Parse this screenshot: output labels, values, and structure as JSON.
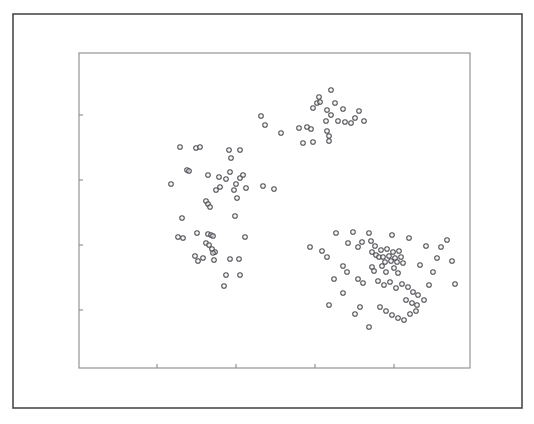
{
  "figure": {
    "title": "",
    "background_color": "#ffffff"
  },
  "outer_frame": {
    "name": "outer-border",
    "x": 13,
    "y": 14,
    "width": 509,
    "height": 394,
    "stroke_color": "#4a4a4a",
    "stroke_width": 1.6
  },
  "chart_data": {
    "type": "scatter",
    "title": "",
    "subtitle": "",
    "xlabel": "",
    "ylabel": "",
    "grid": false,
    "legend": null,
    "legend_position": "none",
    "marker": {
      "shape": "circle",
      "radius_px": 2.3,
      "stroke_color": "#4f4f55",
      "fill_color": "#f2f2f2",
      "stroke_width": 1.05
    },
    "plot_area_px": {
      "x": 79,
      "y": 53,
      "width": 391,
      "height": 315
    },
    "axes": {
      "x": {
        "range_px": [
          79,
          470
        ],
        "tick_positions_px": [
          157,
          236,
          315,
          394
        ],
        "tick_labels": [],
        "tick_length_px": 4,
        "tick_side": "inside-top"
      },
      "y": {
        "range_px": [
          53,
          368
        ],
        "tick_positions_px": [
          115,
          180,
          245,
          310
        ],
        "tick_labels": [],
        "tick_length_px": 4,
        "tick_side": "inside-right"
      }
    },
    "series": [
      {
        "name": "points",
        "n_points": 131,
        "points_px": [
          [
            319,
            97
          ],
          [
            331,
            90
          ],
          [
            317,
            103
          ],
          [
            320,
            102
          ],
          [
            335,
            103
          ],
          [
            313,
            108
          ],
          [
            327,
            110
          ],
          [
            343,
            109
          ],
          [
            359,
            111
          ],
          [
            331,
            115
          ],
          [
            355,
            118
          ],
          [
            326,
            121
          ],
          [
            338,
            121
          ],
          [
            345,
            122
          ],
          [
            351,
            123
          ],
          [
            364,
            121
          ],
          [
            265,
            125
          ],
          [
            281,
            133
          ],
          [
            299,
            128
          ],
          [
            307,
            127
          ],
          [
            311,
            129
          ],
          [
            327,
            131
          ],
          [
            329,
            136
          ],
          [
            329,
            141
          ],
          [
            303,
            143
          ],
          [
            313,
            142
          ],
          [
            261,
            116
          ],
          [
            180,
            147
          ],
          [
            196,
            148
          ],
          [
            200,
            147
          ],
          [
            229,
            150
          ],
          [
            240,
            150
          ],
          [
            231,
            158
          ],
          [
            187,
            170
          ],
          [
            189,
            171
          ],
          [
            208,
            175
          ],
          [
            230,
            172
          ],
          [
            226,
            179
          ],
          [
            240,
            178
          ],
          [
            236,
            184
          ],
          [
            171,
            184
          ],
          [
            220,
            187
          ],
          [
            246,
            188
          ],
          [
            219,
            177
          ],
          [
            243,
            175
          ],
          [
            216,
            190
          ],
          [
            274,
            189
          ],
          [
            206,
            201
          ],
          [
            208,
            204
          ],
          [
            237,
            198
          ],
          [
            234,
            190
          ],
          [
            210,
            207
          ],
          [
            235,
            216
          ],
          [
            182,
            218
          ],
          [
            263,
            186
          ],
          [
            178,
            237
          ],
          [
            183,
            238
          ],
          [
            197,
            233
          ],
          [
            208,
            234
          ],
          [
            211,
            235
          ],
          [
            213,
            236
          ],
          [
            206,
            243
          ],
          [
            209,
            245
          ],
          [
            245,
            237
          ],
          [
            212,
            249
          ],
          [
            215,
            252
          ],
          [
            213,
            253
          ],
          [
            195,
            256
          ],
          [
            203,
            258
          ],
          [
            214,
            260
          ],
          [
            230,
            259
          ],
          [
            239,
            259
          ],
          [
            226,
            275
          ],
          [
            240,
            275
          ],
          [
            224,
            286
          ],
          [
            198,
            261
          ],
          [
            310,
            247
          ],
          [
            322,
            251
          ],
          [
            327,
            257
          ],
          [
            334,
            279
          ],
          [
            353,
            232
          ],
          [
            358,
            247
          ],
          [
            362,
            242
          ],
          [
            369,
            233
          ],
          [
            371,
            241
          ],
          [
            372,
            252
          ],
          [
            375,
            246
          ],
          [
            376,
            255
          ],
          [
            379,
            257
          ],
          [
            381,
            250
          ],
          [
            383,
            257
          ],
          [
            385,
            262
          ],
          [
            387,
            249
          ],
          [
            389,
            256
          ],
          [
            391,
            261
          ],
          [
            393,
            252
          ],
          [
            395,
            258
          ],
          [
            397,
            262
          ],
          [
            399,
            251
          ],
          [
            401,
            257
          ],
          [
            403,
            263
          ],
          [
            372,
            267
          ],
          [
            374,
            271
          ],
          [
            382,
            266
          ],
          [
            386,
            272
          ],
          [
            394,
            268
          ],
          [
            398,
            273
          ],
          [
            343,
            266
          ],
          [
            347,
            272
          ],
          [
            358,
            279
          ],
          [
            363,
            283
          ],
          [
            378,
            281
          ],
          [
            384,
            285
          ],
          [
            390,
            282
          ],
          [
            396,
            288
          ],
          [
            402,
            284
          ],
          [
            408,
            287
          ],
          [
            413,
            292
          ],
          [
            418,
            295
          ],
          [
            406,
            300
          ],
          [
            412,
            303
          ],
          [
            417,
            305
          ],
          [
            380,
            307
          ],
          [
            386,
            311
          ],
          [
            392,
            315
          ],
          [
            398,
            318
          ],
          [
            404,
            320
          ],
          [
            410,
            314
          ],
          [
            416,
            311
          ],
          [
            424,
            300
          ],
          [
            429,
            285
          ],
          [
            433,
            272
          ],
          [
            437,
            258
          ],
          [
            441,
            247
          ],
          [
            447,
            240
          ],
          [
            452,
            261
          ],
          [
            455,
            284
          ],
          [
            343,
            293
          ],
          [
            329,
            305
          ],
          [
            369,
            327
          ],
          [
            355,
            314
          ],
          [
            420,
            265
          ],
          [
            426,
            246
          ],
          [
            409,
            238
          ],
          [
            392,
            235
          ],
          [
            360,
            307
          ],
          [
            348,
            243
          ],
          [
            336,
            233
          ]
        ]
      }
    ]
  }
}
